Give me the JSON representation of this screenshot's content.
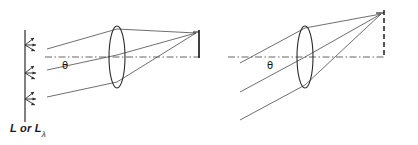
{
  "figure": {
    "title_text": "",
    "source_label_main": "L or L",
    "source_label_sub": "λ",
    "angle_symbol_left": "θ",
    "angle_symbol_right": "θ",
    "colors": {
      "ink": "#1a1a1a",
      "ray": "#4a4a4a",
      "axis": "#555555",
      "background": "#ffffff",
      "detector": "#2b2b2b"
    },
    "panels": [
      {
        "name": "left-panel",
        "description": "Extended source at left emits radiance; lens images it onto a detector at right",
        "angle_label": "θ",
        "has_source_plane": true,
        "detector_style": "solid",
        "axis_style": "dash-dot"
      },
      {
        "name": "right-panel",
        "description": "Rays from a distant direction at angle theta converge through lens to a point on the detector plane",
        "angle_label": "θ",
        "has_source_plane": false,
        "detector_style": "dashed",
        "axis_style": "dash-dot"
      }
    ],
    "elements": {
      "lens_name": "biconvex-lens",
      "axis_name": "optical-axis",
      "detector_name": "detector-plane",
      "ray_name": "light-ray",
      "emitter_name": "radiance-emitter-arrows"
    }
  }
}
